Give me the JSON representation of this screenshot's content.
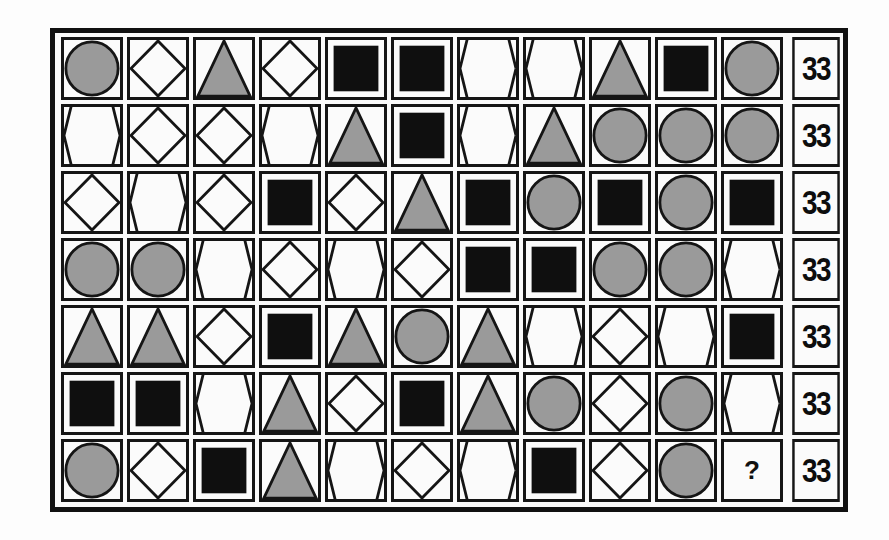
{
  "puzzle": {
    "title": "Shape value grid puzzle",
    "legend": {
      "C": "gray-circle",
      "D": "outline-diamond",
      "T": "gray-triangle",
      "S": "black-square",
      "H": "outline-hexagon",
      "?": "unknown"
    },
    "colors": {
      "gray_fill": "#9a9a9a",
      "black_fill": "#0f0f0f",
      "stroke": "#151515",
      "cell_bg": "#fbfbfb"
    },
    "rows": [
      {
        "cells": [
          "C",
          "D",
          "T",
          "D",
          "S",
          "S",
          "H",
          "H",
          "T",
          "S",
          "C"
        ],
        "total": "33"
      },
      {
        "cells": [
          "H",
          "D",
          "D",
          "H",
          "T",
          "S",
          "H",
          "T",
          "C",
          "C",
          "C"
        ],
        "total": "33"
      },
      {
        "cells": [
          "D",
          "H",
          "D",
          "S",
          "D",
          "T",
          "S",
          "C",
          "S",
          "C",
          "S"
        ],
        "total": "33"
      },
      {
        "cells": [
          "C",
          "C",
          "H",
          "D",
          "H",
          "D",
          "S",
          "S",
          "C",
          "C",
          "H"
        ],
        "total": "33"
      },
      {
        "cells": [
          "T",
          "T",
          "D",
          "S",
          "T",
          "C",
          "T",
          "H",
          "D",
          "H",
          "S"
        ],
        "total": "33"
      },
      {
        "cells": [
          "S",
          "S",
          "H",
          "T",
          "D",
          "S",
          "T",
          "C",
          "D",
          "C",
          "H"
        ],
        "total": "33"
      },
      {
        "cells": [
          "C",
          "D",
          "S",
          "T",
          "H",
          "D",
          "H",
          "S",
          "D",
          "C",
          "?"
        ],
        "total": "33"
      }
    ],
    "question_mark": "?"
  }
}
